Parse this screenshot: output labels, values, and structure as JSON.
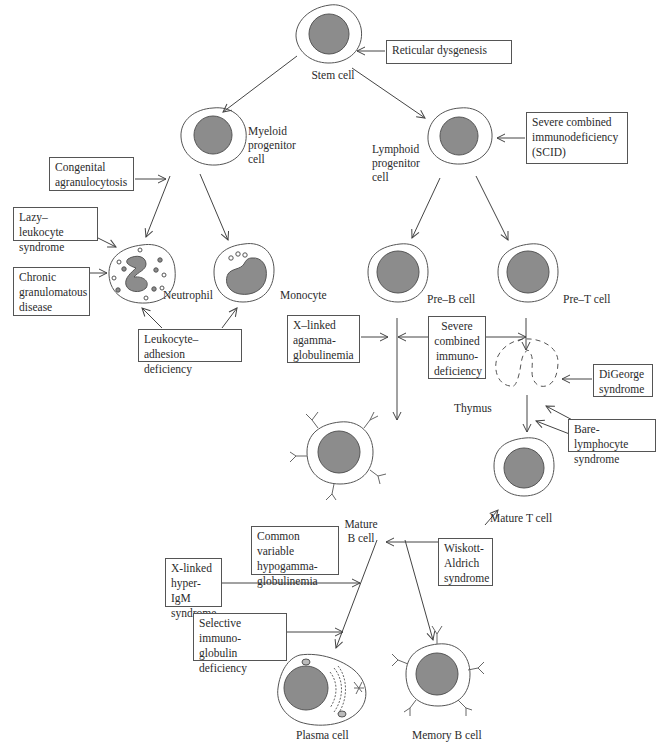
{
  "diagram": {
    "cells": {
      "stem": "Stem cell",
      "myeloid": "Myeloid\nprogenitor\ncell",
      "lymphoid": "Lymphoid\nprogenitor\ncell",
      "neutrophil": "Neutrophil",
      "monocyte": "Monocyte",
      "pre_b": "Pre–B cell",
      "pre_t": "Pre–T cell",
      "thymus": "Thymus",
      "mature_b": "Mature\nB cell",
      "mature_t": "Mature T cell",
      "plasma": "Plasma cell",
      "memory_b": "Memory B cell"
    },
    "disorders": {
      "reticular": "Reticular dysgenesis",
      "scid_top": "Severe combined\nimmunodeficiency\n(SCID)",
      "congenital": "Congenital\nagranulocytosis",
      "lazy": "Lazy–leukocyte\nsyndrome",
      "cgd": "Chronic\ngranulomatous\ndisease",
      "lad": "Leukocyte–adhesion\ndeficiency",
      "xla": "X–linked\nagamma-\nglobulinemia",
      "scid_mid": "Severe\ncombined\nimmuno-\ndeficiency",
      "digeorge": "DiGeorge\nsyndrome",
      "bare": "Bare-lymphocyte\nsyndrome",
      "cvid": "Common variable\nhypogamma-\nglobulinemia",
      "wiskott": "Wiskott-\nAldrich\nsyndrome",
      "hyper_igm": "X-linked\nhyper-IgM\nsyndrome",
      "selective": "Selective immuno-\nglobulin\ndeficiency"
    },
    "colors": {
      "nucleus": "#8c8c8c",
      "outline": "#555555",
      "cytoplasm": "#ffffff"
    }
  }
}
